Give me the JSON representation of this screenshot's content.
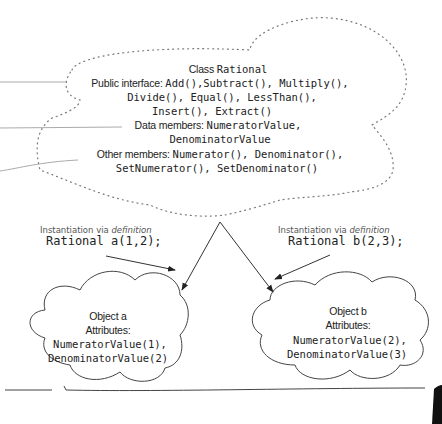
{
  "class_cloud": {
    "title_prefix": "Class",
    "title_name": "Rational",
    "public_label": "Public interface:",
    "public_line1": "Add(),Subtract(), Multiply(),",
    "public_line2": "Divide(), Equal(), LessThan(),",
    "public_line3": "Insert(), Extract()",
    "data_label": "Data members:",
    "data_line1": "NumeratorValue,",
    "data_line2": "DenominatorValue",
    "other_label": "Other members:",
    "other_line1": "Numerator(), Denominator(),",
    "other_line2": "SetNumerator(), SetDenominator()"
  },
  "instantiation_a": {
    "caption_prefix": "Instantiation via",
    "caption_emph": "definition",
    "code": "Rational a(1,2);"
  },
  "instantiation_b": {
    "caption_prefix": "Instantiation via",
    "caption_emph": "definition",
    "code": "Rational b(2,3);"
  },
  "object_a": {
    "title": "Object a",
    "attributes_label": "Attributes:",
    "attr1": "NumeratorValue(1),",
    "attr2": "DenominatorValue(2)"
  },
  "object_b": {
    "title": "Object b",
    "attributes_label": "Attributes:",
    "attr1": "NumeratorValue(2),",
    "attr2": "DenominatorValue(3)"
  },
  "colors": {
    "ink": "#222222",
    "dotted": "#777777",
    "line": "#999999"
  }
}
